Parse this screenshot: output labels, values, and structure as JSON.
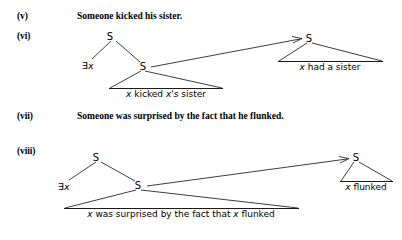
{
  "page": {
    "width": 402,
    "height": 240,
    "background": "#ffffff",
    "ink": "#1a1a1a"
  },
  "examples": [
    {
      "number": "(v)",
      "type": "sentence",
      "text": "Someone kicked his sister."
    },
    {
      "number": "(vi)",
      "type": "tree",
      "nodes": {
        "root_label": "S",
        "quantifier": "∃x",
        "inner_label": "S",
        "inner_clause": "x kicked x's sister",
        "target_label": "S",
        "target_clause": "x had a sister"
      }
    },
    {
      "number": "(vii)",
      "type": "sentence",
      "text": "Someone was surprised by the fact that he flunked."
    },
    {
      "number": "(viii)",
      "type": "tree",
      "nodes": {
        "root_label": "S",
        "quantifier": "∃x",
        "inner_label": "S",
        "inner_clause": "x was surprised by the fact that x flunked",
        "target_label": "S",
        "target_clause": "x flunked"
      }
    }
  ]
}
